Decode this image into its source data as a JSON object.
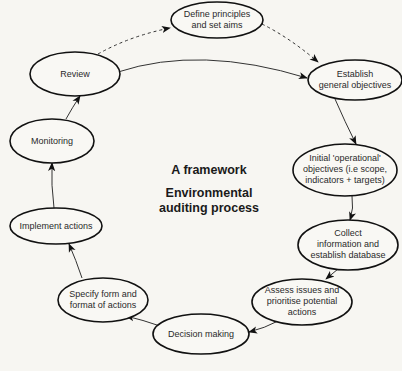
{
  "title": {
    "line1": "A framework",
    "line2": "Environmental",
    "line3": "auditing process"
  },
  "nodes": [
    {
      "id": "define",
      "lines": [
        "Define principles",
        "and set aims"
      ]
    },
    {
      "id": "establish",
      "lines": [
        "Establish",
        "general objectives"
      ]
    },
    {
      "id": "initial",
      "lines": [
        "Initial 'operational'",
        "objectives (i.e scope,",
        "indicators + targets)"
      ]
    },
    {
      "id": "collect",
      "lines": [
        "Collect",
        "information and",
        "establish database"
      ]
    },
    {
      "id": "assess",
      "lines": [
        "Assess issues and",
        "prioritise potential",
        "actions"
      ]
    },
    {
      "id": "decision",
      "lines": [
        "Decision making"
      ]
    },
    {
      "id": "specify",
      "lines": [
        "Specify form and",
        "format of actions"
      ]
    },
    {
      "id": "implement",
      "lines": [
        "Implement actions"
      ]
    },
    {
      "id": "monitoring",
      "lines": [
        "Monitoring"
      ]
    },
    {
      "id": "review",
      "lines": [
        "Review"
      ]
    }
  ],
  "edges": [
    {
      "from": "review",
      "to": "define",
      "style": "dashed"
    },
    {
      "from": "define",
      "to": "establish",
      "style": "dashed"
    },
    {
      "from": "review",
      "to": "establish",
      "style": "solid"
    },
    {
      "from": "establish",
      "to": "initial",
      "style": "solid"
    },
    {
      "from": "initial",
      "to": "collect",
      "style": "solid"
    },
    {
      "from": "collect",
      "to": "assess",
      "style": "solid"
    },
    {
      "from": "assess",
      "to": "decision",
      "style": "solid"
    },
    {
      "from": "decision",
      "to": "specify",
      "style": "solid"
    },
    {
      "from": "specify",
      "to": "implement",
      "style": "solid"
    },
    {
      "from": "implement",
      "to": "monitoring",
      "style": "solid"
    },
    {
      "from": "monitoring",
      "to": "review",
      "style": "solid"
    }
  ]
}
